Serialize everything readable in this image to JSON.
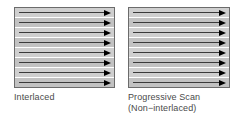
{
  "figure": {
    "background_color": "#ffffff",
    "panel_fill_color": "#cfcfcf",
    "panel_border_color": "#6b6b6b",
    "scan_line_color": "#3a3a3a",
    "arrow_color": "#000000",
    "caption_color": "#4a4a4a"
  },
  "panels": [
    {
      "id": "interlaced",
      "caption_lines": [
        "Interlaced"
      ],
      "scan_line_count": 8,
      "arrow_direction": "right"
    },
    {
      "id": "progressive",
      "caption_lines": [
        "Progressive Scan",
        "(Non−interlaced)"
      ],
      "scan_line_count": 8,
      "arrow_direction": "right"
    }
  ]
}
